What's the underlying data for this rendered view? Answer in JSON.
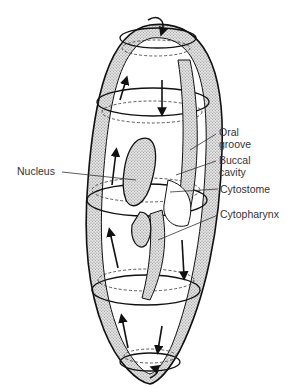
{
  "diagram": {
    "labels": {
      "nucleus": "Nucleus",
      "oral_groove_1": "Oral",
      "oral_groove_2": "groove",
      "buccal_cavity_1": "Buccal",
      "buccal_cavity_2": "cavity",
      "cytostome": "Cytostome",
      "cytopharynx": "Cytopharynx"
    },
    "colors": {
      "line": "#111111",
      "stipple": "#9a9a9a",
      "label_text": "#333333",
      "background": "#ffffff"
    }
  }
}
